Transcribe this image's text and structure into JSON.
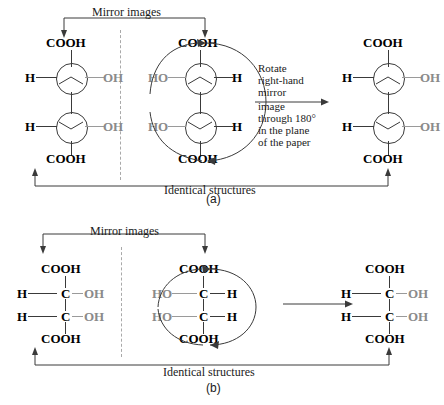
{
  "figure": {
    "panels": [
      {
        "id": "a",
        "caption": "(a)",
        "style": "ball-and-stick circles",
        "top_label": "Mirror images",
        "bottom_label": "Identical structures",
        "rotate_text_lines": [
          "Rotate",
          "right-hand",
          "mirror",
          "image",
          "through 180°",
          "in the plane",
          "of the paper"
        ],
        "structures": [
          {
            "name": "left-structure",
            "top": "COOH",
            "bottom": "COOH",
            "carbons": [
              {
                "left": "H",
                "right": "OH"
              },
              {
                "left": "H",
                "right": "OH"
              }
            ]
          },
          {
            "name": "middle-structure",
            "top": "COOH",
            "bottom": "COOH",
            "carbons": [
              {
                "left": "HO",
                "right": "H"
              },
              {
                "left": "HO",
                "right": "H"
              }
            ]
          },
          {
            "name": "right-structure",
            "top": "COOH",
            "bottom": "COOH",
            "carbons": [
              {
                "left": "H",
                "right": "OH"
              },
              {
                "left": "H",
                "right": "OH"
              }
            ]
          }
        ]
      },
      {
        "id": "b",
        "caption": "(b)",
        "style": "fischer projection",
        "top_label": "Mirror images",
        "bottom_label": "Identical structures",
        "structures": [
          {
            "name": "left-structure",
            "top": "COOH",
            "bottom": "COOH",
            "carbons": [
              {
                "left": "H",
                "center": "C",
                "right": "OH"
              },
              {
                "left": "H",
                "center": "C",
                "right": "OH"
              }
            ]
          },
          {
            "name": "middle-structure",
            "top": "COOH",
            "bottom": "COOH",
            "carbons": [
              {
                "left": "HO",
                "center": "C",
                "right": "H"
              },
              {
                "left": "HO",
                "center": "C",
                "right": "H"
              }
            ]
          },
          {
            "name": "right-structure",
            "top": "COOH",
            "bottom": "COOH",
            "carbons": [
              {
                "left": "H",
                "center": "C",
                "right": "OH"
              },
              {
                "left": "H",
                "center": "C",
                "right": "OH"
              }
            ]
          }
        ]
      }
    ],
    "colors": {
      "ink": "#1a1a1a",
      "bond": "#3a3a3a",
      "dim": "#8a8a8a",
      "mirror": "#a9a9a9",
      "background": "#ffffff"
    }
  }
}
